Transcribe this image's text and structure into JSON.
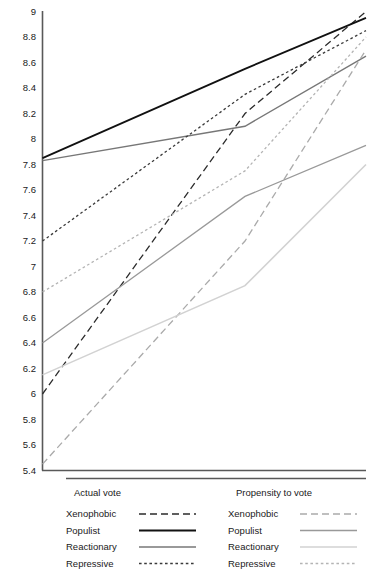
{
  "chart_data": {
    "type": "line",
    "title": "",
    "subtitle": "",
    "xlabel": "",
    "ylabel": "",
    "x": [
      1,
      2,
      3
    ],
    "xtick_labels": [
      "",
      "",
      ""
    ],
    "ylim": [
      5.4,
      9.0
    ],
    "ytick_step": 0.2,
    "ytick_labels": [
      "9",
      "8.8",
      "8.6",
      "8.4",
      "8.2",
      "8",
      "7.8",
      "7.6",
      "7.4",
      "7.2",
      "7",
      "6.8",
      "6.6",
      "6.4",
      "6.2",
      "6",
      "5.8",
      "5.6",
      "5.4"
    ],
    "ytick_values": [
      9,
      8.8,
      8.6,
      8.4,
      8.2,
      8,
      7.8,
      7.6,
      7.4,
      7.2,
      7,
      6.8,
      6.6,
      6.4,
      6.2,
      6,
      5.8,
      5.6,
      5.4
    ],
    "grid": false,
    "legend_position": "bottom",
    "series": [
      {
        "name": "Xenophobic",
        "group": "Actual vote",
        "values": [
          6.0,
          8.2,
          9.0
        ],
        "color": "#2b2b2b",
        "style": "dashed",
        "width": 1.3,
        "dash": "7,4"
      },
      {
        "name": "Populist",
        "group": "Actual vote",
        "values": [
          7.85,
          8.55,
          8.95
        ],
        "color": "#111111",
        "style": "solid",
        "width": 1.8,
        "dash": "none"
      },
      {
        "name": "Reactionary",
        "group": "Actual vote",
        "values": [
          7.83,
          8.1,
          8.65
        ],
        "color": "#777777",
        "style": "solid",
        "width": 1.4,
        "dash": "none"
      },
      {
        "name": "Repressive",
        "group": "Actual vote",
        "values": [
          7.2,
          8.35,
          8.85
        ],
        "color": "#3a3a3a",
        "style": "dotted",
        "width": 1.3,
        "dash": "2.6,2.6"
      },
      {
        "name": "Xenophobic",
        "group": "Propensity to vote",
        "values": [
          5.45,
          7.2,
          8.7
        ],
        "color": "#aaaaaa",
        "style": "dashed",
        "width": 1.3,
        "dash": "7,4"
      },
      {
        "name": "Populist",
        "group": "Propensity to vote",
        "values": [
          6.4,
          7.55,
          7.95
        ],
        "color": "#999999",
        "style": "solid",
        "width": 1.3,
        "dash": "none"
      },
      {
        "name": "Reactionary",
        "group": "Propensity to vote",
        "values": [
          6.15,
          6.85,
          7.8
        ],
        "color": "#d2d2d2",
        "style": "solid",
        "width": 1.6,
        "dash": "none"
      },
      {
        "name": "Repressive",
        "group": "Propensity to vote",
        "values": [
          6.8,
          7.75,
          8.8
        ],
        "color": "#b4b4b4",
        "style": "dotted",
        "width": 1.3,
        "dash": "2.6,2.6"
      }
    ]
  },
  "axes": {
    "y_axis_color": "#595959",
    "x_axis_color": "#595959"
  },
  "legend": {
    "columns": [
      {
        "heading": "Actual vote",
        "entries": [
          {
            "label": "Xenophobic",
            "series_index": 0
          },
          {
            "label": "Populist",
            "series_index": 1
          },
          {
            "label": "Reactionary",
            "series_index": 2
          },
          {
            "label": "Repressive",
            "series_index": 3
          }
        ]
      },
      {
        "heading": "Propensity to vote",
        "entries": [
          {
            "label": "Xenophobic",
            "series_index": 4
          },
          {
            "label": "Populist",
            "series_index": 5
          },
          {
            "label": "Reactionary",
            "series_index": 6
          },
          {
            "label": "Repressive",
            "series_index": 7
          }
        ]
      }
    ]
  }
}
